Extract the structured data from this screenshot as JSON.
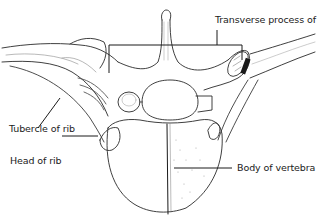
{
  "figure": {
    "labels": {
      "transverse_process": "Transverse process of vertebra",
      "tubercle_of_rib": "Tubercle of rib",
      "head_of_rib": "Head of rib",
      "body_of_vertebra": "Body of vertebra"
    },
    "colors": {
      "line": "#1a1a1a",
      "shade": "#9a9a9a",
      "background": "#ffffff"
    }
  }
}
